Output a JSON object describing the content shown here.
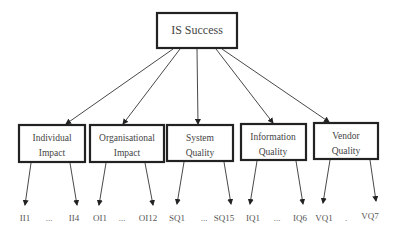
{
  "diagram": {
    "root": {
      "label": "IS Success"
    },
    "categories": [
      {
        "id": "individual-impact",
        "line1": "Individual",
        "line2": "Impact",
        "first": "II1",
        "ellipsis": "...",
        "last": "II4"
      },
      {
        "id": "organisational-impact",
        "line1": "Organisational",
        "line2": "Impact",
        "first": "OI1",
        "ellipsis": "...",
        "last": "OI12"
      },
      {
        "id": "system-quality",
        "line1": "System",
        "line2": "Quality",
        "first": "SQ1",
        "ellipsis": "...",
        "last": "SQ15"
      },
      {
        "id": "information-quality",
        "line1": "Information",
        "line2": "Quality",
        "first": "IQ1",
        "ellipsis": "...",
        "last": "IQ6"
      },
      {
        "id": "vendor-quality",
        "line1": "Vendor",
        "line2": "Quality",
        "first": "VQ1",
        "ellipsis": ".",
        "last": "VQ7"
      }
    ]
  }
}
